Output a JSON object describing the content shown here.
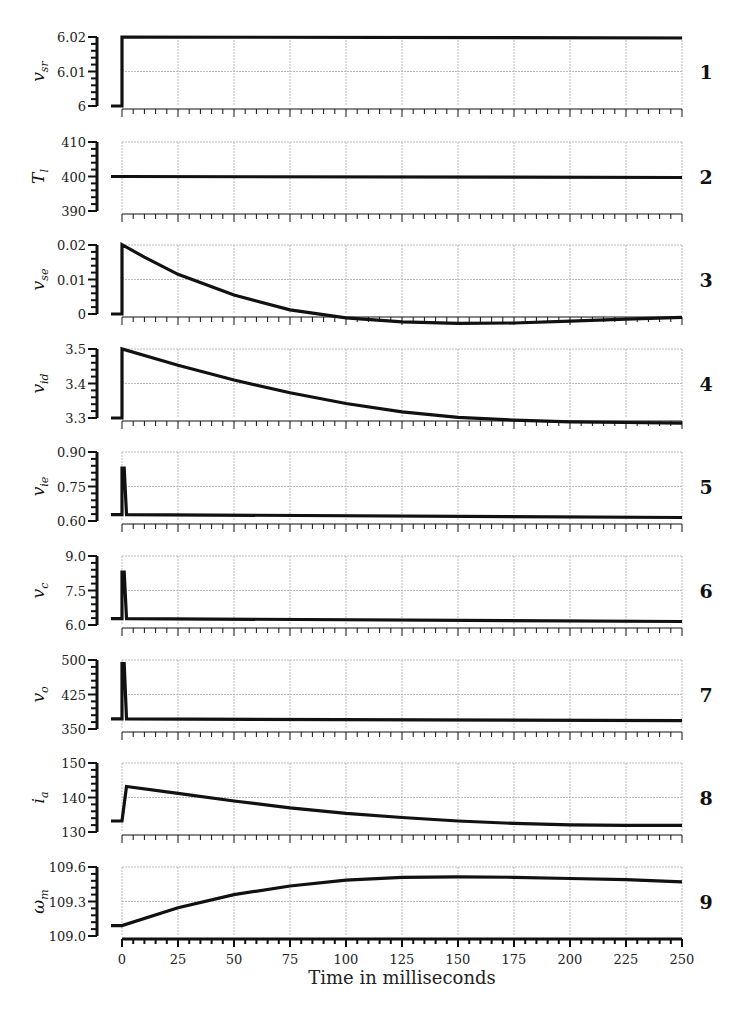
{
  "chart_data": {
    "type": "line",
    "layout": "9 vertically stacked panels sharing time axis",
    "xlabel": "Time in milliseconds",
    "xlim": [
      -5,
      250
    ],
    "xticks": [
      0,
      25,
      50,
      75,
      100,
      125,
      150,
      175,
      200,
      225,
      250
    ],
    "grid": true,
    "panels": [
      {
        "id": 1,
        "label": "v",
        "sub": "sr",
        "ylim": [
          6,
          6.02
        ],
        "yticks": [
          "6",
          "6.01",
          "6.02"
        ],
        "x": [
          -5,
          0,
          0,
          250
        ],
        "y": [
          6,
          6,
          6.02,
          6.0197
        ]
      },
      {
        "id": 2,
        "label": "T",
        "sub": "l",
        "ylim": [
          390,
          410
        ],
        "yticks": [
          "390",
          "400",
          "410"
        ],
        "x": [
          -5,
          0,
          250
        ],
        "y": [
          400,
          400,
          399.7
        ]
      },
      {
        "id": 3,
        "label": "v",
        "sub": "se",
        "ylim": [
          0,
          0.02
        ],
        "yticks": [
          "0",
          "0.01",
          "0.02"
        ],
        "x": [
          -5,
          0,
          0,
          10,
          25,
          50,
          75,
          100,
          125,
          150,
          175,
          200,
          225,
          250
        ],
        "y": [
          0,
          0,
          0.0201,
          0.0165,
          0.0115,
          0.0055,
          0.0012,
          -0.0011,
          -0.0023,
          -0.0027,
          -0.0026,
          -0.0021,
          -0.0015,
          -0.001
        ]
      },
      {
        "id": 4,
        "label": "v",
        "sub": "id",
        "ylim": [
          3.3,
          3.5
        ],
        "yticks": [
          "3.3",
          "3.4",
          "3.5"
        ],
        "x": [
          -5,
          0,
          0,
          25,
          50,
          75,
          100,
          125,
          150,
          175,
          200,
          225,
          250
        ],
        "y": [
          3.3,
          3.3,
          3.5,
          3.453,
          3.41,
          3.373,
          3.342,
          3.318,
          3.302,
          3.294,
          3.289,
          3.287,
          3.285
        ]
      },
      {
        "id": 5,
        "label": "v",
        "sub": "ie",
        "ylim": [
          0.6,
          0.9
        ],
        "yticks": [
          "0.60",
          "0.75",
          "0.90"
        ],
        "x": [
          -5,
          0,
          0,
          1,
          2,
          250
        ],
        "y": [
          0.628,
          0.628,
          0.83,
          0.83,
          0.628,
          0.615
        ]
      },
      {
        "id": 6,
        "label": "v",
        "sub": "c",
        "ylim": [
          6.0,
          9.0
        ],
        "yticks": [
          "6.0",
          "7.5",
          "9.0"
        ],
        "x": [
          -5,
          0,
          0,
          1,
          2,
          250
        ],
        "y": [
          6.28,
          6.28,
          8.3,
          8.3,
          6.28,
          6.15
        ]
      },
      {
        "id": 7,
        "label": "v",
        "sub": "o",
        "ylim": [
          350,
          500
        ],
        "yticks": [
          "350",
          "425",
          "500"
        ],
        "x": [
          -5,
          0,
          0,
          1,
          2,
          250
        ],
        "y": [
          372,
          372,
          492,
          492,
          372,
          368
        ]
      },
      {
        "id": 8,
        "label": "i",
        "sub": "a",
        "ylim": [
          130,
          150
        ],
        "yticks": [
          "130",
          "140",
          "150"
        ],
        "x": [
          -5,
          0,
          2,
          25,
          50,
          75,
          100,
          125,
          150,
          175,
          200,
          225,
          250
        ],
        "y": [
          133.2,
          133.2,
          143.2,
          141.2,
          139.0,
          137.0,
          135.4,
          134.2,
          133.2,
          132.5,
          132.1,
          131.9,
          131.9
        ]
      },
      {
        "id": 9,
        "label": "ω",
        "sub": "m",
        "ylim": [
          109.0,
          109.6
        ],
        "yticks": [
          "109.0",
          "109.3",
          "109.6"
        ],
        "x": [
          -5,
          0,
          25,
          50,
          75,
          100,
          125,
          150,
          175,
          200,
          225,
          250
        ],
        "y": [
          109.09,
          109.09,
          109.245,
          109.36,
          109.435,
          109.485,
          109.51,
          109.515,
          109.51,
          109.5,
          109.49,
          109.47
        ]
      }
    ]
  },
  "panel_numbers": [
    "1",
    "2",
    "3",
    "4",
    "5",
    "6",
    "7",
    "8",
    "9"
  ],
  "x_axis": {
    "title": "Time in milliseconds",
    "tick_labels": [
      "0",
      "25",
      "50",
      "75",
      "100",
      "125",
      "150",
      "175",
      "200",
      "225",
      "250"
    ]
  },
  "colors": {
    "line": "#111111",
    "grid": "#bbbbbb",
    "axis": "#111111"
  }
}
